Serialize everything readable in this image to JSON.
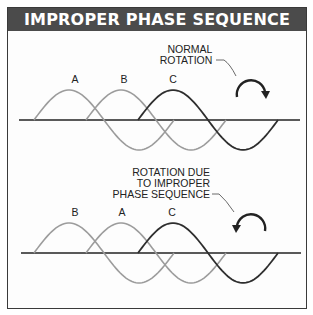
{
  "title": "IMPROPER PHASE SEQUENCE",
  "colors": {
    "header_bg": "#4b4b4b",
    "header_text": "#ffffff",
    "phase_light": "#9c9c9c",
    "phase_dark": "#2e2e2e",
    "axis": "#222222"
  },
  "panels": [
    {
      "name": "normal",
      "caption_lines": [
        "NORMAL",
        "ROTATION"
      ],
      "rotation_direction": "clockwise",
      "phase_labels": [
        "A",
        "B",
        "C"
      ],
      "axis_y": 120
    },
    {
      "name": "improper",
      "caption_lines": [
        "ROTATION DUE",
        "TO IMPROPER",
        "PHASE SEQUENCE"
      ],
      "rotation_direction": "counterclockwise",
      "phase_labels": [
        "B",
        "A",
        "C"
      ],
      "axis_y": 253
    }
  ]
}
